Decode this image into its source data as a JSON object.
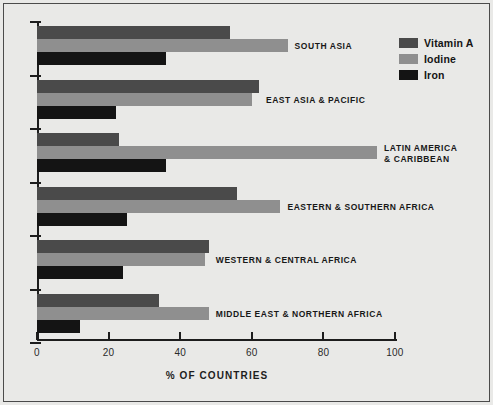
{
  "chart_data": {
    "type": "bar",
    "orientation": "horizontal",
    "title": "",
    "xlabel": "% OF COUNTRIES",
    "ylabel": "",
    "xlim": [
      0,
      100
    ],
    "xticks": [
      "0",
      "20",
      "40",
      "60",
      "80",
      "100"
    ],
    "xtick_values": [
      0,
      20,
      40,
      60,
      80,
      100
    ],
    "grid": false,
    "legend_position": "top-right",
    "categories": [
      "SOUTH ASIA",
      "EAST ASIA & PACIFIC",
      "LATIN AMERICA\n& CARIBBEAN",
      "EASTERN & SOUTHERN AFRICA",
      "WESTERN & CENTRAL AFRICA",
      "MIDDLE EAST & NORTHERN AFRICA"
    ],
    "series": [
      {
        "name": "Vitamin A",
        "color": "#4a4a4a",
        "values": [
          54,
          62,
          23,
          56,
          48,
          34
        ]
      },
      {
        "name": "Iodine",
        "color": "#8f8f8f",
        "values": [
          70,
          60,
          95,
          68,
          47,
          48
        ]
      },
      {
        "name": "Iron",
        "color": "#141414",
        "values": [
          36,
          22,
          36,
          25,
          24,
          12
        ]
      }
    ]
  },
  "legend": {
    "items": [
      {
        "label": "Vitamin A",
        "color": "#4a4a4a",
        "swatch_name": "legend-swatch-vitamin-a"
      },
      {
        "label": "Iodine",
        "color": "#8f8f8f",
        "swatch_name": "legend-swatch-iodine"
      },
      {
        "label": "Iron",
        "color": "#141414",
        "swatch_name": "legend-swatch-iron"
      }
    ]
  },
  "axis": {
    "x_title": "% OF COUNTRIES",
    "x_tick_labels": [
      "0",
      "20",
      "40",
      "60",
      "80",
      "100"
    ]
  },
  "category_labels": [
    {
      "lines": [
        "SOUTH ASIA"
      ]
    },
    {
      "lines": [
        "EAST ASIA & PACIFIC"
      ]
    },
    {
      "lines": [
        "LATIN AMERICA",
        "& CARIBBEAN"
      ]
    },
    {
      "lines": [
        "EASTERN & SOUTHERN AFRICA"
      ]
    },
    {
      "lines": [
        "WESTERN & CENTRAL AFRICA"
      ]
    },
    {
      "lines": [
        "MIDDLE EAST & NORTHERN AFRICA"
      ]
    }
  ],
  "colors": {
    "background": "#e9e9e7",
    "frame": "#4b4b4b",
    "axis": "#1d1d1d",
    "vitamin_a": "#4a4a4a",
    "iodine": "#8f8f8f",
    "iron": "#141414"
  }
}
